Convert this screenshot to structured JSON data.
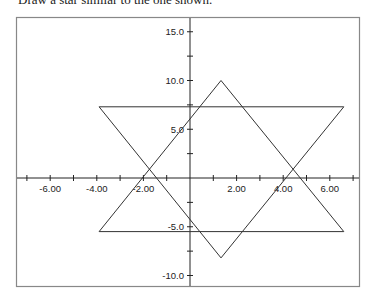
{
  "caption": "Draw a star similar to the one shown.",
  "chart_data": {
    "type": "line",
    "title": "",
    "xlabel": "",
    "ylabel": "",
    "xlim": [
      -7.6,
      7.3
    ],
    "ylim": [
      -11.0,
      16.6
    ],
    "grid": false,
    "x_ticks": [
      -7,
      -6,
      -5,
      -4,
      -3,
      -2,
      -1,
      1,
      2,
      3,
      4,
      5,
      6,
      7
    ],
    "x_tick_labels": [
      {
        "value": -6,
        "label": "-6.00"
      },
      {
        "value": -4,
        "label": "-4.00"
      },
      {
        "value": -2,
        "label": "-2.00"
      },
      {
        "value": 2,
        "label": "2.00"
      },
      {
        "value": 4,
        "label": "4.00"
      },
      {
        "value": 6,
        "label": "6.00"
      }
    ],
    "y_ticks": [
      -10,
      -7.5,
      -5,
      -2.5,
      2.5,
      5,
      7.5,
      10,
      12.5,
      15
    ],
    "y_tick_labels": [
      {
        "value": 15,
        "label": "15.0"
      },
      {
        "value": 10,
        "label": "10.0"
      },
      {
        "value": 5,
        "label": "5.0"
      },
      {
        "value": -5,
        "label": "-5.0"
      },
      {
        "value": -10,
        "label": "-10.0"
      }
    ],
    "series": [
      {
        "name": "upward triangle",
        "points": [
          [
            1.33,
            10.0
          ],
          [
            -3.9,
            -5.5
          ],
          [
            6.6,
            -5.5
          ],
          [
            1.33,
            10.0
          ]
        ]
      },
      {
        "name": "downward triangle",
        "points": [
          [
            1.33,
            -8.2
          ],
          [
            -3.9,
            7.3
          ],
          [
            6.6,
            7.3
          ],
          [
            1.33,
            -8.2
          ]
        ]
      }
    ]
  },
  "colors": {
    "frame": "#888888",
    "axes": "#222222",
    "lines": "#333333"
  }
}
